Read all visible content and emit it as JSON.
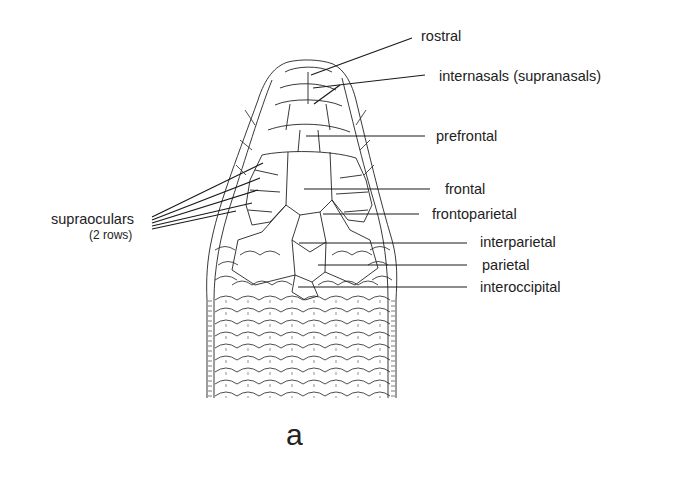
{
  "figure": {
    "caption": "a"
  },
  "labels": {
    "rostral": "rostral",
    "internasals": "internasals (supranasals)",
    "prefrontal": "prefrontal",
    "frontal": "frontal",
    "frontoparietal": "frontoparietal",
    "interparietal": "interparietal",
    "parietal": "parietal",
    "interoccipital": "interoccipital",
    "supraoculars": "supraoculars",
    "supraoculars_note": "(2 rows)"
  },
  "colors": {
    "ink": "#1a1a1a",
    "background": "#ffffff"
  }
}
